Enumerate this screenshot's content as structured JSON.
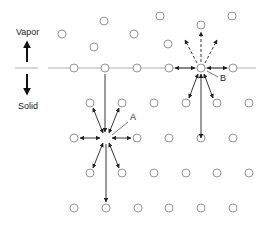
{
  "labels": {
    "vapor": "Vapor",
    "solid": "Solid",
    "site_a": "A",
    "site_b": "B"
  },
  "colors": {
    "circle_stroke": "#8a8a8a",
    "surface_line": "#b0b0b0",
    "arrow": "#222222",
    "text": "#222222"
  },
  "surface_y": 68,
  "vacancy_a": {
    "x": 106,
    "y": 138
  },
  "vacancy_b": {
    "x": 201,
    "y": 68
  },
  "vapor_atoms": [
    [
      104,
      21
    ],
    [
      62,
      34
    ],
    [
      134,
      34
    ],
    [
      160,
      16
    ],
    [
      232,
      16
    ],
    [
      201,
      25
    ],
    [
      94,
      47
    ],
    [
      168,
      44
    ]
  ],
  "lattice_atoms": [
    [
      74,
      68
    ],
    [
      105,
      68
    ],
    [
      137,
      68
    ],
    [
      169,
      68
    ],
    [
      233,
      68
    ],
    [
      90,
      103
    ],
    [
      122,
      103
    ],
    [
      154,
      103
    ],
    [
      186,
      103
    ],
    [
      217,
      103
    ],
    [
      249,
      103
    ],
    [
      74,
      138
    ],
    [
      137,
      138
    ],
    [
      169,
      138
    ],
    [
      201,
      138
    ],
    [
      233,
      138
    ],
    [
      90,
      173
    ],
    [
      122,
      173
    ],
    [
      154,
      173
    ],
    [
      186,
      173
    ],
    [
      217,
      173
    ],
    [
      249,
      173
    ],
    [
      74,
      208
    ],
    [
      106,
      208
    ],
    [
      138,
      208
    ],
    [
      169,
      208
    ],
    [
      201,
      208
    ],
    [
      233,
      208
    ]
  ]
}
